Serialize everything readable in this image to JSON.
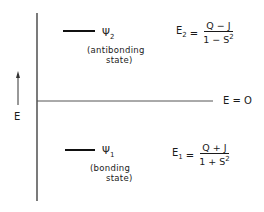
{
  "diagram": {
    "axis_label": "E",
    "zero_label": "E = O",
    "levels": [
      {
        "name": "antibonding",
        "psi_symbol": "Ψ",
        "psi_subscript": "2",
        "description_line1": "(antibonding",
        "description_line2": "state)",
        "energy_label": "E",
        "energy_subscript": "2",
        "equals": "=",
        "numerator": "Q − J",
        "denominator_base": "1 − S",
        "denominator_sup": "2"
      },
      {
        "name": "bonding",
        "psi_symbol": "Ψ",
        "psi_subscript": "1",
        "description_line1": "(bonding",
        "description_line2": "state)",
        "energy_label": "E",
        "energy_subscript": "1",
        "equals": "=",
        "numerator": "Q + J",
        "denominator_base": "1 + S",
        "denominator_sup": "2"
      }
    ],
    "colors": {
      "ink": "#1a1a1a",
      "zero_line": "#555555",
      "background": "#ffffff"
    }
  }
}
